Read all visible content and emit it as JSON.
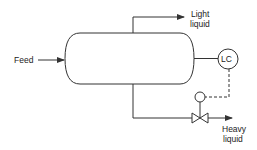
{
  "diagram": {
    "type": "process-flow",
    "colors": {
      "line": "#333333",
      "background": "#ffffff"
    },
    "vessel": {
      "name": "separator-vessel",
      "shape": "horizontal-drum"
    },
    "labels": {
      "feed": "Feed",
      "light_line1": "Light",
      "light_line2": "liquid",
      "heavy_line1": "Heavy",
      "heavy_line2": "liquid",
      "controller": "LC"
    },
    "streams": [
      {
        "name": "feed",
        "direction": "in",
        "label": "Feed"
      },
      {
        "name": "light-liquid",
        "direction": "out",
        "label": "Light liquid"
      },
      {
        "name": "heavy-liquid",
        "direction": "out",
        "label": "Heavy liquid"
      }
    ],
    "instruments": [
      {
        "tag": "LC",
        "type": "level-controller"
      },
      {
        "type": "valve-actuator"
      },
      {
        "type": "control-valve"
      }
    ],
    "signal_line": "dashed"
  }
}
